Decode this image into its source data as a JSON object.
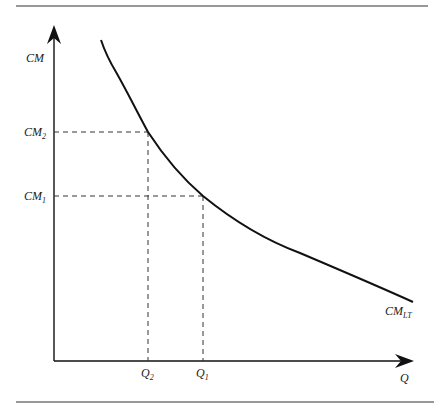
{
  "diagram": {
    "type": "economics-cost-curve",
    "y_axis_label": "CM",
    "x_axis_label": "Q",
    "curve_label": {
      "main": "CM",
      "sub": "LT"
    },
    "y_ticks": [
      {
        "main": "CM",
        "sub": "2",
        "y": 132
      },
      {
        "main": "CM",
        "sub": "1",
        "y": 196
      }
    ],
    "x_ticks": [
      {
        "main": "Q",
        "sub": "2",
        "x": 148
      },
      {
        "main": "Q",
        "sub": "1",
        "x": 203
      }
    ],
    "colors": {
      "line": "#111111",
      "dash": "#333333",
      "rule": "#333333"
    }
  }
}
